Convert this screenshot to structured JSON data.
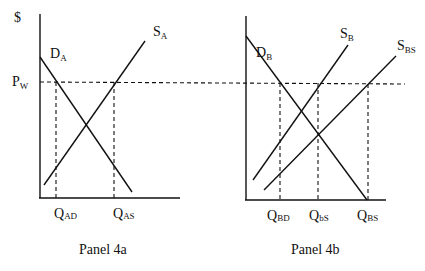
{
  "y_axis_label": "$",
  "price_label": {
    "main": "P",
    "sub": "W"
  },
  "panel_a": {
    "caption": "Panel 4a",
    "demand": {
      "main": "D",
      "sub": "A"
    },
    "supply": {
      "main": "S",
      "sub": "A"
    },
    "q_labels": [
      {
        "main": "Q",
        "sub": "AD"
      },
      {
        "main": "Q",
        "sub": "AS"
      }
    ]
  },
  "panel_b": {
    "caption": "Panel 4b",
    "demand": {
      "main": "D",
      "sub": "B"
    },
    "supply": {
      "main": "S",
      "sub": "B"
    },
    "supply_shifted": {
      "main": "S",
      "sub": "BS"
    },
    "q_labels": [
      {
        "main": "Q",
        "sub": "BD"
      },
      {
        "main": "Q",
        "sub": "bS"
      },
      {
        "main": "Q",
        "sub": "BS"
      }
    ]
  },
  "colors": {
    "ink": "#111111",
    "background": "#ffffff"
  }
}
